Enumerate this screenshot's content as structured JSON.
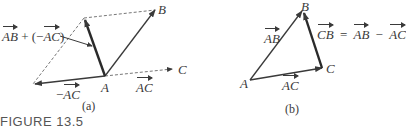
{
  "figure": {
    "caption": "FIGURE 13.5",
    "panels": [
      {
        "id": "a",
        "label": "(a)",
        "points": {
          "A": "A",
          "B": "B",
          "C": "C"
        },
        "vectors": {
          "resultant_lhs": "AB",
          "resultant_plus": "+ (−",
          "resultant_rhs": "AC",
          "resultant_close": ")",
          "neg_ac_sign": "−",
          "neg_ac": "AC",
          "ac": "AC"
        }
      },
      {
        "id": "b",
        "label": "(b)",
        "points": {
          "A": "A",
          "B": "B",
          "C": "C"
        },
        "vectors": {
          "ab": "AB",
          "ac": "AC",
          "cb": "CB",
          "eq": "=",
          "eq_ab": "AB",
          "minus": "−",
          "eq_ac": "AC"
        }
      }
    ]
  }
}
